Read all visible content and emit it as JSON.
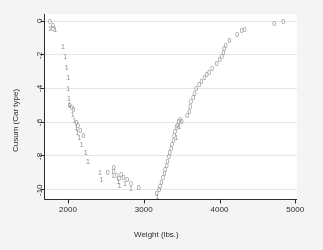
{
  "figure": {
    "background_color": "#f4f4f4",
    "plot_background_color": "#ffffff",
    "axis_color": "#2b2b2b",
    "grid_color": "#e6e6e6",
    "marker_color": "#8e8e94"
  },
  "chart_data": {
    "type": "scatter",
    "title": "",
    "xlabel": "Weight (lbs.)",
    "ylabel": "Cusum (Car type)",
    "xlim": [
      1680,
      5020
    ],
    "ylim": [
      -10.6,
      0.4
    ],
    "xticks": [
      2000,
      3000,
      4000,
      5000
    ],
    "xticklabels": [
      "2000",
      "3000",
      "4000",
      "5000"
    ],
    "yticks": [
      0,
      -2,
      -4,
      -6,
      -8,
      -10
    ],
    "yticklabels": [
      "0",
      "-2",
      "-4",
      "-6",
      "-8",
      "-10"
    ],
    "grid": "horizontal",
    "legend": "none",
    "marker_style": "digit-glyph",
    "series": [
      {
        "name": "Foreign (marker 0)",
        "glyph": "0",
        "points": [
          [
            1760,
            -0.05
          ],
          [
            1800,
            -0.28
          ],
          [
            1800,
            -0.48
          ],
          [
            2020,
            -5.05
          ],
          [
            2050,
            -5.15
          ],
          [
            2070,
            -5.3
          ],
          [
            2110,
            -6.05
          ],
          [
            2130,
            -6.2
          ],
          [
            2160,
            -6.55
          ],
          [
            2200,
            -6.8
          ],
          [
            2520,
            -9.05
          ],
          [
            2600,
            -8.7
          ],
          [
            2600,
            -8.95
          ],
          [
            2640,
            -9.2
          ],
          [
            2670,
            -9.4
          ],
          [
            2700,
            -9.15
          ],
          [
            2730,
            -9.35
          ],
          [
            2780,
            -9.45
          ],
          [
            2830,
            -9.7
          ],
          [
            2930,
            -9.9
          ],
          [
            3170,
            -10.3
          ],
          [
            3200,
            -10.05
          ],
          [
            3210,
            -9.85
          ],
          [
            3230,
            -9.6
          ],
          [
            3250,
            -9.35
          ],
          [
            3270,
            -9.1
          ],
          [
            3280,
            -8.85
          ],
          [
            3300,
            -8.6
          ],
          [
            3310,
            -8.35
          ],
          [
            3330,
            -8.1
          ],
          [
            3340,
            -7.85
          ],
          [
            3360,
            -7.6
          ],
          [
            3370,
            -7.35
          ],
          [
            3390,
            -7.1
          ],
          [
            3400,
            -6.85
          ],
          [
            3410,
            -6.6
          ],
          [
            3430,
            -6.35
          ],
          [
            3440,
            -6.2
          ],
          [
            3460,
            -6.0
          ],
          [
            3480,
            -5.85
          ],
          [
            3500,
            -6.0
          ],
          [
            3570,
            -5.65
          ],
          [
            3600,
            -5.4
          ],
          [
            3610,
            -5.1
          ],
          [
            3620,
            -4.8
          ],
          [
            3650,
            -4.55
          ],
          [
            3670,
            -4.3
          ],
          [
            3690,
            -4.05
          ],
          [
            3730,
            -3.8
          ],
          [
            3760,
            -3.6
          ],
          [
            3800,
            -3.4
          ],
          [
            3830,
            -3.2
          ],
          [
            3860,
            -3.05
          ],
          [
            3900,
            -2.85
          ],
          [
            3960,
            -2.55
          ],
          [
            4000,
            -2.3
          ],
          [
            4030,
            -2.1
          ],
          [
            4050,
            -1.9
          ],
          [
            4060,
            -1.65
          ],
          [
            4080,
            -1.45
          ],
          [
            4130,
            -1.15
          ],
          [
            4230,
            -0.8
          ],
          [
            4290,
            -0.6
          ],
          [
            4330,
            -0.55
          ],
          [
            4720,
            -0.18
          ],
          [
            4840,
            -0.02
          ]
        ]
      },
      {
        "name": "Domestic (marker 1)",
        "glyph": "1",
        "points": [
          [
            1760,
            -0.48
          ],
          [
            1830,
            -0.52
          ],
          [
            1930,
            -1.55
          ],
          [
            1960,
            -2.15
          ],
          [
            1980,
            -2.8
          ],
          [
            2000,
            -3.4
          ],
          [
            2000,
            -4.05
          ],
          [
            2010,
            -4.6
          ],
          [
            2020,
            -5.0
          ],
          [
            2060,
            -5.6
          ],
          [
            2080,
            -5.95
          ],
          [
            2110,
            -6.35
          ],
          [
            2120,
            -6.65
          ],
          [
            2150,
            -6.95
          ],
          [
            2180,
            -7.35
          ],
          [
            2230,
            -7.85
          ],
          [
            2260,
            -8.35
          ],
          [
            2420,
            -9.0
          ],
          [
            2440,
            -9.45
          ],
          [
            2590,
            -9.2
          ],
          [
            2660,
            -9.55
          ],
          [
            2680,
            -9.8
          ],
          [
            2750,
            -9.65
          ],
          [
            2830,
            -10.0
          ],
          [
            3180,
            -10.45
          ],
          [
            3430,
            -6.95
          ],
          [
            3470,
            -6.3
          ]
        ]
      }
    ]
  }
}
